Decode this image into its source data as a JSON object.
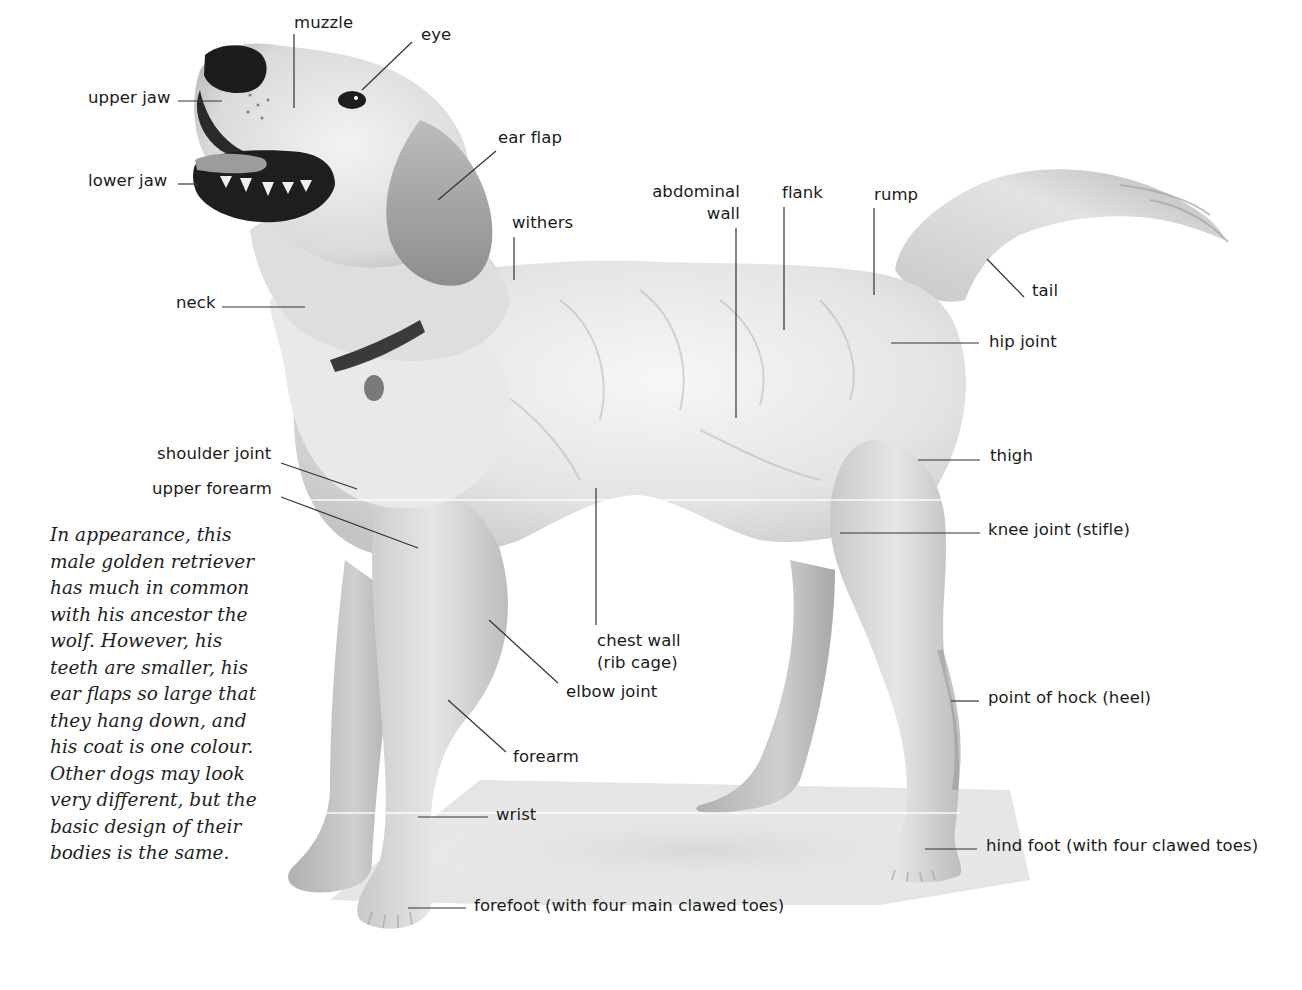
{
  "diagram": {
    "subject": "male golden retriever",
    "type": "anatomy diagram",
    "colors": {
      "background": "#ffffff",
      "label_text": "#1a1a1a",
      "leader_line": "#333333",
      "fur_light": "#efefef",
      "fur_mid": "#cfcfcf",
      "fur_dark": "#9a9a9a",
      "nose": "#1c1c1c",
      "shadow": "#d6d6d6"
    }
  },
  "labels": {
    "muzzle": "muzzle",
    "eye": "eye",
    "upper_jaw": "upper jaw",
    "lower_jaw": "lower jaw",
    "ear_flap": "ear flap",
    "withers": "withers",
    "neck": "neck",
    "abdominal_wall": "abdominal\nwall",
    "flank": "flank",
    "rump": "rump",
    "tail": "tail",
    "hip_joint": "hip joint",
    "shoulder_joint": "shoulder joint",
    "upper_forearm": "upper forearm",
    "thigh": "thigh",
    "knee_joint": "knee joint (stifle)",
    "chest_wall": "chest wall\n(rib cage)",
    "elbow_joint": "elbow joint",
    "point_of_hock": "point of hock (heel)",
    "forearm": "forearm",
    "wrist": "wrist",
    "hind_foot": "hind foot (with four clawed toes)",
    "forefoot": "forefoot (with four main clawed toes)"
  },
  "caption": {
    "lines": [
      "In appearance, this",
      "male golden retriever",
      "has much in common",
      "with his ancestor the",
      "wolf. However, his",
      "teeth are smaller, his",
      "ear flaps so large that",
      "they hang down, and",
      "his coat is one colour.",
      "Other dogs may look",
      "very different, but the",
      "basic design of their",
      "bodies is the same."
    ]
  }
}
